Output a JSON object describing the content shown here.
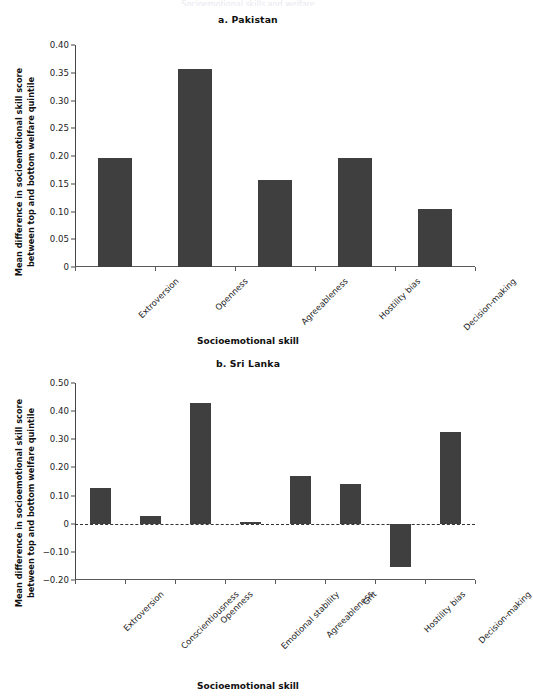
{
  "figure": {
    "background": "#ffffff",
    "bar_color": "#3f3f3f",
    "axis_color": "#5a5a5a",
    "cropped_header": "Socioemotional skills and welfare"
  },
  "chart_data": [
    {
      "type": "bar",
      "title": "a. Pakistan",
      "xlabel": "Socioemotional skill",
      "ylabel": "Mean difference in socioemotional skill score between top and bottom welfare quintile",
      "ylabel_line1": "Mean difference in socioemotional skill score",
      "ylabel_line2": "between top and bottom welfare quintile",
      "categories": [
        "Extroversion",
        "Openness",
        "Agreeableness",
        "Hostility bias",
        "Decision-making"
      ],
      "values": [
        0.197,
        0.356,
        0.156,
        0.197,
        0.105
      ],
      "ylim": [
        0,
        0.4
      ],
      "yticks": [
        0,
        0.05,
        0.1,
        0.15,
        0.2,
        0.25,
        0.3,
        0.35,
        0.4
      ],
      "ytick_labels": [
        "0",
        "0.05",
        "0.10",
        "0.15",
        "0.20",
        "0.25",
        "0.30",
        "0.35",
        "0.40"
      ],
      "grid": false,
      "legend": "none",
      "zero_line": false
    },
    {
      "type": "bar",
      "title": "b. Sri Lanka",
      "xlabel": "Socioemotional skill",
      "ylabel": "Mean difference in socioemotional skill score between top and bottom welfare quintile",
      "ylabel_line1": "Mean difference in socioemotional skill score",
      "ylabel_line2": "between top and bottom welfare quintile",
      "categories": [
        "Extroversion",
        "Conscientiousness",
        "Openness",
        "Emotional stability",
        "Agreeableness",
        "Grit",
        "Hostility bias",
        "Decision-making"
      ],
      "values": [
        0.128,
        0.027,
        0.43,
        0.006,
        0.168,
        0.142,
        -0.155,
        0.325
      ],
      "ylim": [
        -0.2,
        0.5
      ],
      "yticks": [
        -0.2,
        -0.1,
        0,
        0.1,
        0.2,
        0.3,
        0.4,
        0.5
      ],
      "ytick_labels": [
        "−0.20",
        "−0.10",
        "0",
        "0.10",
        "0.20",
        "0.30",
        "0.40",
        "0.50"
      ],
      "grid": false,
      "legend": "none",
      "zero_line": true
    }
  ]
}
